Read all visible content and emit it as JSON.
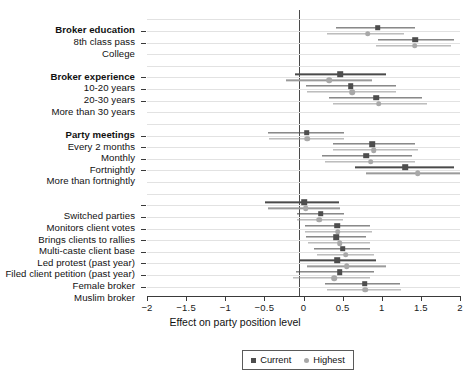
{
  "chart_data": {
    "type": "scatter",
    "title": "",
    "xlabel": "Effect on party position level",
    "ylabel": "",
    "xlim": [
      -2,
      2
    ],
    "xticks": [
      -2,
      -1.5,
      -1,
      -0.5,
      0,
      0.5,
      1,
      1.5,
      2
    ],
    "xticklabels": [
      "-2",
      "-1.5",
      "-1",
      "-0.5",
      "0",
      "0.5",
      "1",
      "1.5",
      "2"
    ],
    "grid": true,
    "zero_reference_line": 0,
    "legend": {
      "position": "bottom-center",
      "entries": [
        {
          "name": "Current",
          "marker": "square",
          "color": "#4d4d4d"
        },
        {
          "name": "Highest",
          "marker": "circle",
          "color": "#a8a8a8"
        }
      ]
    },
    "groups": [
      {
        "header": "Broker education",
        "rows": [
          {
            "label": "8th class pass",
            "series": [
              {
                "name": "Current",
                "estimate": 0.95,
                "ci_low": 0.42,
                "ci_high": 1.42
              },
              {
                "name": "Highest",
                "estimate": 0.82,
                "ci_low": 0.3,
                "ci_high": 1.28
              }
            ]
          },
          {
            "label": "College",
            "series": [
              {
                "name": "Current",
                "estimate": 1.43,
                "ci_low": 0.95,
                "ci_high": 1.93
              },
              {
                "name": "Highest",
                "estimate": 1.42,
                "ci_low": 0.92,
                "ci_high": 1.88
              }
            ]
          }
        ]
      },
      {
        "header": "Broker experience",
        "rows": [
          {
            "label": "10-20 years",
            "series": [
              {
                "name": "Current",
                "estimate": 0.47,
                "ci_low": -0.11,
                "ci_high": 1.05
              },
              {
                "name": "Highest",
                "estimate": 0.33,
                "ci_low": -0.22,
                "ci_high": 0.88
              }
            ]
          },
          {
            "label": "20-30 years",
            "series": [
              {
                "name": "Current",
                "estimate": 0.6,
                "ci_low": 0.03,
                "ci_high": 1.18
              },
              {
                "name": "Highest",
                "estimate": 0.62,
                "ci_low": 0.05,
                "ci_high": 1.18
              }
            ]
          },
          {
            "label": "More than 30 years",
            "series": [
              {
                "name": "Current",
                "estimate": 0.93,
                "ci_low": 0.33,
                "ci_high": 1.52
              },
              {
                "name": "Highest",
                "estimate": 0.96,
                "ci_low": 0.38,
                "ci_high": 1.58
              }
            ]
          }
        ]
      },
      {
        "header": "Party meetings",
        "rows": [
          {
            "label": "Every 2 months",
            "series": [
              {
                "name": "Current",
                "estimate": 0.04,
                "ci_low": -0.46,
                "ci_high": 0.52
              },
              {
                "name": "Highest",
                "estimate": 0.05,
                "ci_low": -0.44,
                "ci_high": 0.52
              }
            ]
          },
          {
            "label": "Monthly",
            "series": [
              {
                "name": "Current",
                "estimate": 0.88,
                "ci_low": 0.37,
                "ci_high": 1.43
              },
              {
                "name": "Highest",
                "estimate": 0.9,
                "ci_low": 0.38,
                "ci_high": 1.46
              }
            ]
          },
          {
            "label": "Fortnightly",
            "series": [
              {
                "name": "Current",
                "estimate": 0.8,
                "ci_low": 0.23,
                "ci_high": 1.38
              },
              {
                "name": "Highest",
                "estimate": 0.86,
                "ci_low": 0.28,
                "ci_high": 1.42
              }
            ]
          },
          {
            "label": "More than fortnightly",
            "series": [
              {
                "name": "Current",
                "estimate": 1.3,
                "ci_low": 0.66,
                "ci_high": 1.93
              },
              {
                "name": "Highest",
                "estimate": 1.46,
                "ci_low": 0.8,
                "ci_high": 2.0
              }
            ]
          }
        ]
      },
      {
        "header": "",
        "rows": [
          {
            "label": "Switched parties",
            "series": [
              {
                "name": "Current",
                "estimate": 0.01,
                "ci_low": -0.49,
                "ci_high": 0.45
              },
              {
                "name": "Highest",
                "estimate": 0.03,
                "ci_low": -0.46,
                "ci_high": 0.47
              }
            ]
          },
          {
            "label": "Monitors client votes",
            "series": [
              {
                "name": "Current",
                "estimate": 0.22,
                "ci_low": -0.08,
                "ci_high": 0.52
              },
              {
                "name": "Highest",
                "estimate": 0.2,
                "ci_low": -0.08,
                "ci_high": 0.5
              }
            ]
          },
          {
            "label": "Brings clients to rallies",
            "series": [
              {
                "name": "Current",
                "estimate": 0.43,
                "ci_low": 0.02,
                "ci_high": 0.85
              },
              {
                "name": "Highest",
                "estimate": 0.44,
                "ci_low": 0.02,
                "ci_high": 0.87
              }
            ]
          },
          {
            "label": "Multi-caste client base",
            "series": [
              {
                "name": "Current",
                "estimate": 0.42,
                "ci_low": 0.03,
                "ci_high": 0.8
              },
              {
                "name": "Highest",
                "estimate": 0.46,
                "ci_low": 0.06,
                "ci_high": 0.85
              }
            ]
          },
          {
            "label": "Led protest (past year)",
            "series": [
              {
                "name": "Current",
                "estimate": 0.5,
                "ci_low": 0.13,
                "ci_high": 0.85
              },
              {
                "name": "Highest",
                "estimate": 0.54,
                "ci_low": 0.17,
                "ci_high": 0.9
              }
            ]
          },
          {
            "label": "Filed client petition (past year)",
            "series": [
              {
                "name": "Current",
                "estimate": 0.43,
                "ci_low": -0.06,
                "ci_high": 0.93
              },
              {
                "name": "Highest",
                "estimate": 0.55,
                "ci_low": 0.05,
                "ci_high": 1.05
              }
            ]
          },
          {
            "label": "Female broker",
            "series": [
              {
                "name": "Current",
                "estimate": 0.46,
                "ci_low": -0.1,
                "ci_high": 0.9
              },
              {
                "name": "Highest",
                "estimate": 0.39,
                "ci_low": -0.13,
                "ci_high": 0.85
              }
            ]
          },
          {
            "label": "Muslim broker",
            "series": [
              {
                "name": "Current",
                "estimate": 0.78,
                "ci_low": 0.27,
                "ci_high": 1.23
              },
              {
                "name": "Highest",
                "estimate": 0.79,
                "ci_low": 0.3,
                "ci_high": 1.25
              }
            ]
          }
        ]
      }
    ]
  }
}
